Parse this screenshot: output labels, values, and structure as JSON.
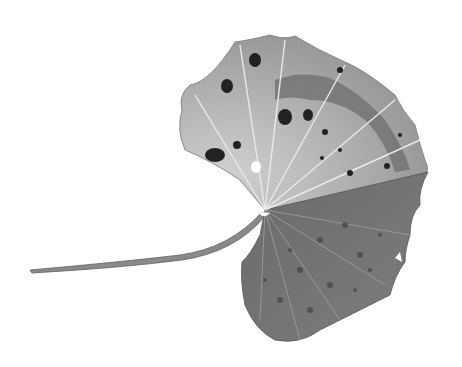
{
  "image": {
    "subject": "Pencil drawing of a spotted, diseased round leaf with a long curved stem",
    "background_color": "#ffffff",
    "colors": {
      "leaf_light": "#c8c8c8",
      "leaf_mid": "#9a9a9a",
      "leaf_dark": "#5e5e5e",
      "spots": "#2a2a2a",
      "veins": "#e8e8e8",
      "stem": "#7a7a7a"
    }
  }
}
